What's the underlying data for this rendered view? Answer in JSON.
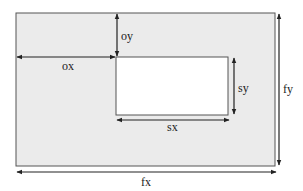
{
  "diagram": {
    "colors": {
      "frame_fill": "#ebebeb",
      "inner_fill": "#ffffff",
      "stroke": "#555555",
      "arrow": "#222222",
      "label": "#222222"
    },
    "frame": {
      "label": "frame",
      "x": 16,
      "y": 13,
      "width": 259,
      "height": 153
    },
    "inner_rect": {
      "label": "inner-rectangle",
      "x": 116,
      "y": 57,
      "width": 112,
      "height": 58
    },
    "dimensions": {
      "ox": {
        "label": "ox",
        "axis": "horizontal",
        "from": [
          17,
          57
        ],
        "to": [
          115,
          57
        ],
        "label_pos": [
          62,
          70
        ]
      },
      "oy": {
        "label": "oy",
        "axis": "vertical",
        "from": [
          117,
          14
        ],
        "to": [
          117,
          56
        ],
        "label_pos": [
          121,
          40
        ]
      },
      "sx": {
        "label": "sx",
        "axis": "horizontal",
        "from": [
          117,
          120
        ],
        "to": [
          229,
          120
        ],
        "label_pos": [
          167,
          131
        ]
      },
      "sy": {
        "label": "sy",
        "axis": "vertical",
        "from": [
          234,
          58
        ],
        "to": [
          234,
          114
        ],
        "label_pos": [
          238,
          92
        ]
      },
      "fx": {
        "label": "fx",
        "axis": "horizontal",
        "from": [
          17,
          172
        ],
        "to": [
          276,
          172
        ],
        "label_pos": [
          141,
          186
        ]
      },
      "fy": {
        "label": "fy",
        "axis": "vertical",
        "from": [
          279,
          14
        ],
        "to": [
          279,
          165
        ],
        "label_pos": [
          283,
          93
        ]
      }
    }
  }
}
